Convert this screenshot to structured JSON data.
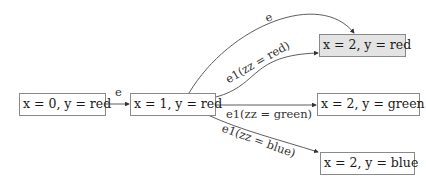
{
  "diagram": {
    "type": "state-transition-graph",
    "nodes": [
      {
        "id": "s0",
        "label": "x = 0, y = red",
        "highlighted": false
      },
      {
        "id": "s1",
        "label": "x = 1, y = red",
        "highlighted": false
      },
      {
        "id": "s2_red",
        "label": "x = 2, y = red",
        "highlighted": true
      },
      {
        "id": "s2_green",
        "label": "x = 2, y = green",
        "highlighted": false
      },
      {
        "id": "s2_blue",
        "label": "x = 2, y = blue",
        "highlighted": false
      }
    ],
    "edges": [
      {
        "from": "s0",
        "to": "s1",
        "label": "e"
      },
      {
        "from": "s1",
        "to": "s2_red",
        "label": "e"
      },
      {
        "from": "s1",
        "to": "s2_red",
        "label": "e1(zz = red)"
      },
      {
        "from": "s1",
        "to": "s2_green",
        "label": "e1(zz = green)"
      },
      {
        "from": "s1",
        "to": "s2_blue",
        "label": "e1(zz = blue)"
      }
    ],
    "colors": {
      "border": "#8a8a8a",
      "highlight_fill": "#e3e3e3",
      "edge": "#333333"
    }
  }
}
